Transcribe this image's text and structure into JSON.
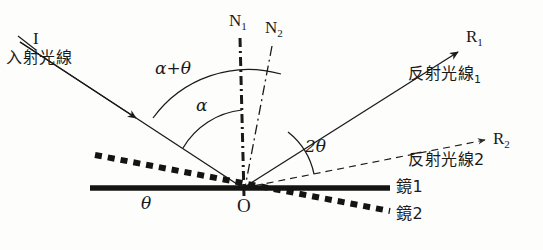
{
  "figure": {
    "type": "optics-ray-diagram",
    "background_color": "#fdfdfc",
    "ink_color": "#1a1a1a"
  },
  "points": {
    "origin_label": "O",
    "origin_x": 243,
    "origin_y": 188
  },
  "rays": {
    "incident": {
      "id": "I",
      "name": "入射光線",
      "start_x": 20,
      "start_y": 42,
      "end_x": 243,
      "end_y": 188,
      "style": "solid",
      "arrow": "mid"
    },
    "reflected_1": {
      "id": "R",
      "id_sub": "1",
      "name": "反射光線",
      "name_sub": "1",
      "start_x": 243,
      "start_y": 188,
      "end_x": 458,
      "end_y": 52,
      "style": "solid",
      "arrow": "end"
    },
    "reflected_2": {
      "id": "R",
      "id_sub": "2",
      "name": "反射光線2",
      "start_x": 243,
      "start_y": 188,
      "end_x": 485,
      "end_y": 140,
      "style": "dashed",
      "arrow": "end"
    }
  },
  "normals": {
    "n1": {
      "label": "N",
      "label_sub": "1",
      "style": "dash-dot-thick",
      "top_x": 240,
      "top_y": 38,
      "bottom_x": 244,
      "bottom_y": 196
    },
    "n2": {
      "label": "N",
      "label_sub": "2",
      "style": "dash-dot-thin",
      "top_x": 272,
      "top_y": 46,
      "bottom_x": 244,
      "bottom_y": 193
    }
  },
  "mirrors": {
    "mirror1": {
      "label": "鏡1",
      "style": "solid-thick",
      "left_x": 90,
      "left_y": 188,
      "right_x": 390,
      "right_y": 188
    },
    "mirror2": {
      "label": "鏡2",
      "style": "dotted-thick",
      "left_x": 95,
      "left_y": 155,
      "right_x": 390,
      "right_y": 211
    }
  },
  "angles": {
    "alpha_plus_theta": {
      "label": "α+θ",
      "label_x": 155,
      "label_y": 62,
      "arc_radius": 118
    },
    "alpha": {
      "label": "α",
      "label_x": 196,
      "label_y": 99,
      "arc_radius": 78
    },
    "two_theta": {
      "label": "2θ",
      "label_x": 305,
      "label_y": 140,
      "arc_radius": 72
    },
    "theta": {
      "label": "θ",
      "label_x": 141,
      "label_y": 197
    }
  }
}
